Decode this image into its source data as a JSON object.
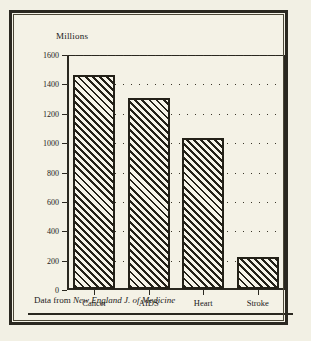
{
  "figure": {
    "axis_title": "Millions",
    "caption_prefix": "Data from",
    "caption_source": "New England J. of Medicine"
  },
  "colors": {
    "paper": "#f2f0e4",
    "panel": "#f4f2e6",
    "ink": "#2a2820",
    "bar_fill": "#f6f4e9",
    "bar_hatch": "#232118"
  },
  "chart_data": {
    "type": "bar",
    "title": "",
    "subtitle": "",
    "xlabel": "",
    "ylabel": "Millions",
    "categories": [
      "Cancer",
      "AIDS",
      "Heart",
      "Stroke"
    ],
    "values": [
      1460,
      1300,
      1030,
      215
    ],
    "series": [
      {
        "name": "Deaths",
        "values": [
          1460,
          1300,
          1030,
          215
        ]
      }
    ],
    "ylim": [
      0,
      1600
    ],
    "yticks": [
      0,
      200,
      400,
      600,
      800,
      1000,
      1200,
      1400,
      1600
    ],
    "ytick_labels": [
      "0",
      "200",
      "400",
      "600",
      "800",
      "1000",
      "1200",
      "1400",
      "1600"
    ],
    "grid": true,
    "grid_style": "dotted-horizontal",
    "legend": false,
    "legend_position": "none",
    "bar_style": "diagonal-hatch",
    "annotations": [
      "Data from New England J. of Medicine"
    ]
  }
}
